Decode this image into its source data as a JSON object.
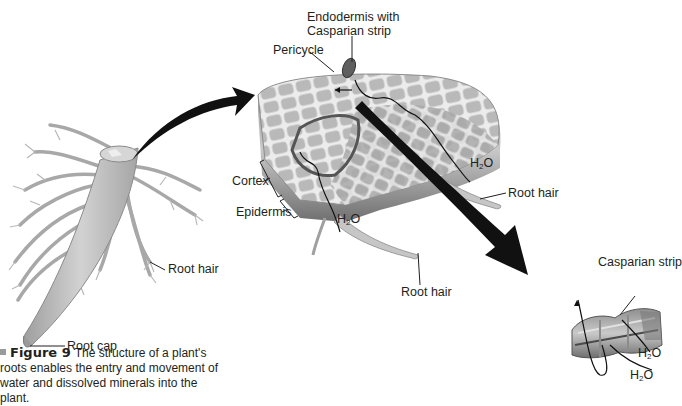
{
  "figure": {
    "number_label": "Figure 9",
    "caption": "The structure of a plant's roots enables the entry and movement of water and dissolved minerals into the plant.",
    "caption_visible": "The structure of a plant's roots enables the entry and movement of water and dissolved minerals into the plant."
  },
  "labels": {
    "root_hair_left": "Root hair",
    "root_cap": "Root cap",
    "endodermis_line1": "Endodermis with",
    "endodermis_line2": "Casparian strip",
    "pericycle": "Pericycle",
    "cortex": "Cortex",
    "epidermis": "Epidermis",
    "h2o_right": "H",
    "h2o_bottom": "H",
    "root_hair_right": "Root hair",
    "root_hair_bottom": "Root hair",
    "casparian_strip": "Casparian strip",
    "h2o_cell_1": "H",
    "h2o_cell_2": "H",
    "subscript_2": "2",
    "oxygen": "O"
  },
  "icons": {
    "arrow_to_cross_section": "curved-arrow-icon",
    "arrow_to_endodermis_cells": "diagonal-arrow-icon"
  },
  "colors": {
    "cell_fill": "#bdbdbd",
    "cell_wall": "#e9e9e9",
    "root_fill": "#c8c8c8",
    "arrow": "#111111",
    "text": "#231f20"
  }
}
